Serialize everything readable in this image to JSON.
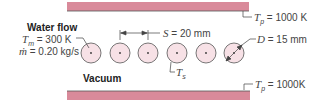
{
  "diagram": {
    "flow_label": "Water flow",
    "tm_label": "T",
    "tm_sub": "m",
    "tm_value": " = 300 K",
    "mdot_label": "ṁ",
    "mdot_value": " = 0.20 kg/s",
    "vacuum_label": "Vacuum",
    "spacing_label": "S",
    "spacing_value": " = 20 mm",
    "diameter_label": "D",
    "diameter_value": " = 15 mm",
    "ts_label": "T",
    "ts_sub": "s",
    "top_plate_label": "T",
    "top_plate_sub": "p",
    "top_plate_value": " = 1000 K",
    "bottom_plate_label": "T",
    "bottom_plate_sub": "p",
    "bottom_plate_value": " = 1000K",
    "colors": {
      "plate": "#d98a9a",
      "tube_fill": "#f7e1e6",
      "tube_stroke": "#555555"
    }
  }
}
